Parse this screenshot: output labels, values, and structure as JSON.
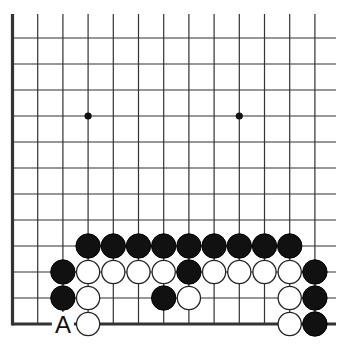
{
  "diagram": {
    "type": "go-board-fragment",
    "columns": 13,
    "rows": 12,
    "edges": [
      "left",
      "bottom"
    ],
    "colors": {
      "line": "#333333",
      "black_stone": "#111111",
      "white_stone": "#ffffff",
      "background": "#ffffff"
    },
    "star_points": [
      {
        "col": 3,
        "row": 3
      },
      {
        "col": 9,
        "row": 3
      }
    ],
    "stones": [
      {
        "color": "black",
        "col": 3,
        "row": 9
      },
      {
        "color": "black",
        "col": 4,
        "row": 9
      },
      {
        "color": "black",
        "col": 5,
        "row": 9
      },
      {
        "color": "black",
        "col": 6,
        "row": 9
      },
      {
        "color": "black",
        "col": 7,
        "row": 9
      },
      {
        "color": "black",
        "col": 8,
        "row": 9
      },
      {
        "color": "black",
        "col": 9,
        "row": 9
      },
      {
        "color": "black",
        "col": 10,
        "row": 9
      },
      {
        "color": "black",
        "col": 11,
        "row": 9
      },
      {
        "color": "black",
        "col": 2,
        "row": 10
      },
      {
        "color": "white",
        "col": 3,
        "row": 10
      },
      {
        "color": "white",
        "col": 4,
        "row": 10
      },
      {
        "color": "white",
        "col": 5,
        "row": 10
      },
      {
        "color": "white",
        "col": 6,
        "row": 10
      },
      {
        "color": "black",
        "col": 7,
        "row": 10
      },
      {
        "color": "white",
        "col": 8,
        "row": 10
      },
      {
        "color": "white",
        "col": 9,
        "row": 10
      },
      {
        "color": "white",
        "col": 10,
        "row": 10
      },
      {
        "color": "white",
        "col": 11,
        "row": 10
      },
      {
        "color": "black",
        "col": 12,
        "row": 10
      },
      {
        "color": "black",
        "col": 2,
        "row": 11
      },
      {
        "color": "white",
        "col": 3,
        "row": 11
      },
      {
        "color": "black",
        "col": 6,
        "row": 11
      },
      {
        "color": "white",
        "col": 7,
        "row": 11
      },
      {
        "color": "white",
        "col": 11,
        "row": 11
      },
      {
        "color": "black",
        "col": 12,
        "row": 11
      },
      {
        "color": "white",
        "col": 3,
        "row": 12
      },
      {
        "color": "white",
        "col": 11,
        "row": 12
      },
      {
        "color": "black",
        "col": 12,
        "row": 12
      }
    ],
    "labels": [
      {
        "text": "A",
        "col": 2,
        "row": 12
      }
    ]
  }
}
